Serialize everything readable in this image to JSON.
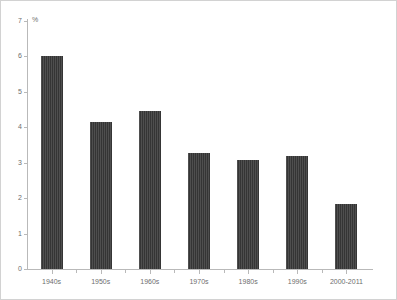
{
  "chart_data": {
    "type": "bar",
    "title": "",
    "subtitle": "",
    "xlabel": "",
    "ylabel": "",
    "unit_label": "%",
    "categories": [
      "1940s",
      "1950s",
      "1960s",
      "1970s",
      "1980s",
      "1990s",
      "2000-2011"
    ],
    "values": [
      6.0,
      4.15,
      4.45,
      3.27,
      3.07,
      3.2,
      1.83
    ],
    "ylim": [
      0,
      7
    ],
    "ytick_labels": [
      "0",
      "1",
      "2",
      "3",
      "4",
      "5",
      "6",
      "7"
    ],
    "ytick_values": [
      0,
      1,
      2,
      3,
      4,
      5,
      6,
      7
    ],
    "grid": false,
    "legend": null,
    "legend_position": "none",
    "annotations": [],
    "colors": {
      "bar": "#3b3b3b",
      "axis": "#b9b9b9",
      "tick_text": "#6e6e6e",
      "frame": "#d2d2d2",
      "background": "#ffffff"
    }
  }
}
